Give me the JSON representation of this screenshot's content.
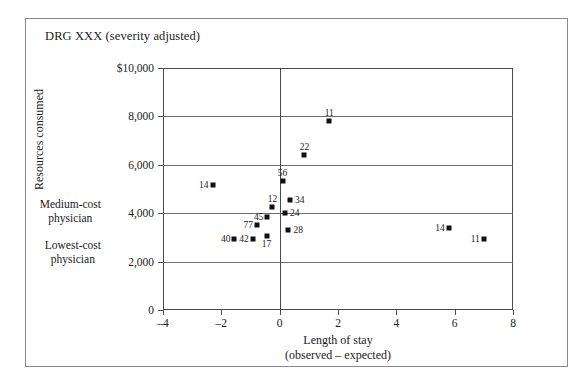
{
  "figure": {
    "title": "DRG XXX (severity adjusted)"
  },
  "axes": {
    "y_title": "Resources consumed",
    "x_title_line1": "Length of stay",
    "x_title_line2": "(observed – expected)",
    "y_ticks": [
      "$10,000",
      "8,000",
      "6,000",
      "4,000",
      "2,000",
      "0"
    ],
    "x_ticks": [
      "–4",
      "–2",
      "0",
      "2",
      "4",
      "6",
      "8"
    ]
  },
  "annotations": {
    "medium_cost_line1": "Medium-cost",
    "medium_cost_line2": "physician",
    "lowest_cost_line1": "Lowest-cost",
    "lowest_cost_line2": "physician"
  },
  "chart_data": {
    "type": "scatter",
    "title": "DRG XXX (severity adjusted)",
    "xlabel": "Length of stay (observed – expected)",
    "ylabel": "Resources consumed",
    "xlim": [
      -4,
      8
    ],
    "ylim": [
      0,
      10000
    ],
    "xticks": [
      -4,
      -2,
      0,
      2,
      4,
      6,
      8
    ],
    "yticks": [
      0,
      2000,
      4000,
      6000,
      8000,
      10000
    ],
    "grid": "horizontal",
    "reference_lines": [
      {
        "axis": "x",
        "value": 0
      }
    ],
    "legend": "none",
    "point_label_field": "physician id",
    "points": [
      {
        "label": "14",
        "x": -2.3,
        "y": 5150,
        "label_pos": "left"
      },
      {
        "label": "11",
        "x": 1.7,
        "y": 7800,
        "label_pos": "above"
      },
      {
        "label": "22",
        "x": 0.85,
        "y": 6400,
        "label_pos": "above"
      },
      {
        "label": "56",
        "x": 0.1,
        "y": 5350,
        "label_pos": "above"
      },
      {
        "label": "34",
        "x": 0.35,
        "y": 4550,
        "label_pos": "right"
      },
      {
        "label": "12",
        "x": -0.25,
        "y": 4250,
        "label_pos": "above"
      },
      {
        "label": "24",
        "x": 0.18,
        "y": 4000,
        "label_pos": "right"
      },
      {
        "label": "45",
        "x": -0.42,
        "y": 3850,
        "label_pos": "left"
      },
      {
        "label": "77",
        "x": -0.78,
        "y": 3500,
        "label_pos": "left"
      },
      {
        "label": "28",
        "x": 0.3,
        "y": 3300,
        "label_pos": "right"
      },
      {
        "label": "17",
        "x": -0.45,
        "y": 3050,
        "label_pos": "below"
      },
      {
        "label": "42",
        "x": -0.92,
        "y": 2950,
        "label_pos": "left"
      },
      {
        "label": "40",
        "x": -1.55,
        "y": 2950,
        "label_pos": "left"
      },
      {
        "label": "14",
        "x": 5.8,
        "y": 3400,
        "label_pos": "left"
      },
      {
        "label": "11",
        "x": 7.0,
        "y": 2950,
        "label_pos": "left"
      }
    ]
  }
}
